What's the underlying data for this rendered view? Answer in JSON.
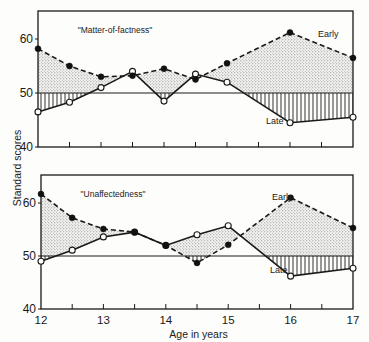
{
  "chart_data": [
    {
      "type": "line",
      "title": "\"Matter-of-factness\"",
      "xlabel": "Age in years",
      "ylabel": "Standard scores",
      "x": [
        12,
        12.5,
        13,
        13.5,
        14,
        14.5,
        15,
        16,
        17
      ],
      "series": [
        {
          "name": "Early",
          "style": "dashed, filled circles",
          "values": [
            58.2,
            55.0,
            53.0,
            53.2,
            54.5,
            52.5,
            55.5,
            61.2,
            56.5
          ]
        },
        {
          "name": "Late",
          "style": "solid, open circles",
          "values": [
            46.5,
            48.3,
            51.0,
            54.0,
            48.5,
            53.5,
            52.0,
            44.5,
            45.5
          ]
        }
      ],
      "baseline": 50,
      "shading": {
        "above_baseline": "stippled",
        "below_baseline": "vertical hatching"
      },
      "yticks": [
        40,
        50,
        60
      ],
      "ylim": [
        40,
        65
      ],
      "xlim": [
        12,
        17
      ]
    },
    {
      "type": "line",
      "title": "\"Unaffectedness\"",
      "xlabel": "Age in years",
      "ylabel": "Standard scores",
      "x": [
        12,
        12.5,
        13,
        13.5,
        14,
        14.5,
        15,
        16,
        17
      ],
      "series": [
        {
          "name": "Early",
          "style": "dashed, filled circles",
          "values": [
            61.7,
            57.2,
            55.1,
            54.5,
            52.0,
            48.7,
            52.1,
            61.0,
            55.3
          ]
        },
        {
          "name": "Late",
          "style": "solid, open circles",
          "values": [
            49.0,
            51.1,
            53.6,
            54.5,
            52.0,
            54.0,
            55.7,
            46.2,
            47.7
          ]
        }
      ],
      "baseline": 50,
      "shading": {
        "above_baseline": "stippled",
        "below_baseline": "vertical hatching"
      },
      "yticks": [
        40,
        50,
        60
      ],
      "xticks": [
        12,
        13,
        14,
        15,
        16,
        17
      ],
      "ylim": [
        40,
        65
      ],
      "xlim": [
        12,
        17
      ]
    }
  ],
  "labels": {
    "ylabel": "Standard scores",
    "xlabel": "Age in years",
    "early": "Early",
    "late": "Late"
  },
  "panels": [
    {
      "title": "\"Matter-of-factness\"",
      "early_label_pos": [
        318,
        37
      ],
      "late_label_pos": [
        266,
        124
      ]
    },
    {
      "title": "\"Unaffectedness\"",
      "early_label_pos": [
        272,
        200
      ],
      "late_label_pos": [
        270,
        273
      ]
    }
  ],
  "colors": {
    "ink": "#1a1a1a",
    "stipple": "#9a9a9a",
    "background": "#fdfdfb"
  }
}
